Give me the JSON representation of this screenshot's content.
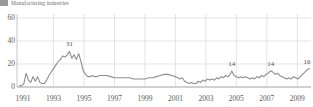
{
  "legend": {
    "label": "Manufacturing industries",
    "swatch_color": "#9a9a9a",
    "marker_icon": "square-swatch-icon"
  },
  "axes": {
    "y_ticks": [
      "0",
      "20",
      "40",
      "60"
    ],
    "y_values": [
      0,
      20,
      40,
      60
    ],
    "y_min": 0,
    "y_max": 60,
    "x_ticks": [
      "1991",
      "1993",
      "1995",
      "1997",
      "1999",
      "2001",
      "2003",
      "2005",
      "2007",
      "2009"
    ],
    "x_values": [
      1991,
      1993,
      1995,
      1997,
      1999,
      2001,
      2003,
      2005,
      2007,
      2009
    ],
    "x_min": 1990.6,
    "x_max": 2009.9,
    "grid": true,
    "ylabel": "",
    "xlabel": ""
  },
  "annotations": [
    {
      "label": "31",
      "x": 1994.05,
      "y": 31
    },
    {
      "label": "14",
      "x": 2004.7,
      "y": 14
    },
    {
      "label": "14",
      "x": 2007.25,
      "y": 14
    },
    {
      "label": "16",
      "x": 2009.7,
      "y": 16
    }
  ],
  "style": {
    "line_color": "#8d8e92",
    "grid_color": "#d9d9dc",
    "axis_color": "#b6b6b9",
    "text_color": "#5b5c60",
    "background": "#ffffff"
  },
  "chart_data": {
    "type": "line",
    "title": "",
    "subtitle": "",
    "xlabel": "",
    "ylabel": "",
    "xlim": [
      1990.6,
      2009.9
    ],
    "ylim": [
      0,
      60
    ],
    "grid": true,
    "legend_position": "top-left",
    "series": [
      {
        "name": "Manufacturing industries",
        "color": "#8d8e92",
        "x": [
          1990.75,
          1990.9,
          1991.05,
          1991.2,
          1991.35,
          1991.5,
          1991.65,
          1991.8,
          1991.95,
          1992.1,
          1992.25,
          1992.4,
          1992.55,
          1992.7,
          1992.85,
          1993.0,
          1993.15,
          1993.3,
          1993.45,
          1993.6,
          1993.75,
          1993.9,
          1994.05,
          1994.2,
          1994.35,
          1994.5,
          1994.65,
          1994.8,
          1994.95,
          1995.1,
          1995.25,
          1995.4,
          1995.55,
          1995.7,
          1995.85,
          1996.0,
          1996.25,
          1996.5,
          1996.75,
          1997.0,
          1997.25,
          1997.5,
          1997.75,
          1998.0,
          1998.25,
          1998.5,
          1998.75,
          1999.0,
          1999.25,
          1999.5,
          1999.75,
          2000.0,
          2000.25,
          2000.5,
          2000.75,
          2001.0,
          2001.15,
          2001.3,
          2001.45,
          2001.6,
          2001.75,
          2001.9,
          2002.05,
          2002.2,
          2002.35,
          2002.5,
          2002.65,
          2002.8,
          2002.95,
          2003.1,
          2003.25,
          2003.4,
          2003.55,
          2003.7,
          2003.85,
          2004.0,
          2004.15,
          2004.3,
          2004.45,
          2004.6,
          2004.7,
          2004.85,
          2005.0,
          2005.15,
          2005.3,
          2005.45,
          2005.6,
          2005.75,
          2005.9,
          2006.05,
          2006.2,
          2006.35,
          2006.5,
          2006.65,
          2006.8,
          2006.95,
          2007.1,
          2007.25,
          2007.4,
          2007.55,
          2007.7,
          2007.85,
          2008.0,
          2008.15,
          2008.3,
          2008.45,
          2008.6,
          2008.75,
          2008.9,
          2009.05,
          2009.2,
          2009.35,
          2009.5,
          2009.65,
          2009.8
        ],
        "y": [
          1,
          1,
          3,
          12,
          6,
          4,
          9,
          5,
          9,
          4,
          3,
          3,
          6,
          10,
          13,
          16,
          19,
          22,
          24,
          27,
          26,
          28,
          31,
          25,
          28,
          24,
          29,
          22,
          14,
          11,
          9,
          9,
          10,
          9,
          9,
          10,
          10,
          10,
          9,
          8,
          8,
          8,
          8,
          8,
          7,
          7,
          7,
          7,
          8,
          8,
          9,
          10,
          11,
          11,
          10,
          9,
          8,
          7,
          8,
          5,
          4,
          3,
          4,
          3,
          3,
          5,
          4,
          6,
          5,
          7,
          6,
          7,
          6,
          8,
          7,
          9,
          8,
          10,
          9,
          11,
          14,
          10,
          9,
          8,
          9,
          8,
          9,
          8,
          7,
          8,
          7,
          9,
          8,
          10,
          9,
          11,
          12,
          14,
          13,
          11,
          12,
          10,
          9,
          8,
          7,
          8,
          7,
          9,
          8,
          7,
          9,
          11,
          13,
          15,
          16
        ]
      }
    ],
    "annotated_points": [
      {
        "label": "31",
        "x": 1994.05,
        "y": 31
      },
      {
        "label": "14",
        "x": 2004.7,
        "y": 14
      },
      {
        "label": "14",
        "x": 2007.25,
        "y": 14
      },
      {
        "label": "16",
        "x": 2009.8,
        "y": 16
      }
    ]
  }
}
